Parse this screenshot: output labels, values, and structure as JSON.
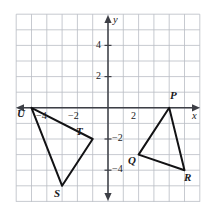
{
  "figure": {
    "colors": {
      "grid": "#b9bcc4",
      "axis": "#3d3f46",
      "shape_stroke": "#121214",
      "text": "#19191c",
      "background": "#ffffff"
    }
  },
  "grid": {
    "x_min": -6,
    "x_max": 6,
    "y_min": -6,
    "y_max": 6,
    "step": 1,
    "show": true
  },
  "axes": {
    "x_label": "x",
    "y_label": "y",
    "x_ticks": [
      {
        "value": -4,
        "label": "−4"
      },
      {
        "value": -2,
        "label": "−2"
      },
      {
        "value": 2,
        "label": "2"
      }
    ],
    "y_ticks": [
      {
        "value": 4,
        "label": "4"
      },
      {
        "value": 2,
        "label": "2"
      },
      {
        "value": -2,
        "label": "−2"
      },
      {
        "value": -4,
        "label": "−4"
      }
    ],
    "arrows": [
      "left",
      "right",
      "up",
      "down"
    ]
  },
  "shapes": [
    {
      "name": "triangle-pqr",
      "label": "PQR",
      "vertices": [
        {
          "label": "P",
          "x": 4,
          "y": 0
        },
        {
          "label": "Q",
          "x": 2,
          "y": -3
        },
        {
          "label": "R",
          "x": 5,
          "y": -4
        }
      ]
    },
    {
      "name": "triangle-stu",
      "label": "STU",
      "vertices": [
        {
          "label": "U",
          "x": -5,
          "y": 0
        },
        {
          "label": "T",
          "x": -1,
          "y": -2
        },
        {
          "label": "S",
          "x": -3,
          "y": -5
        }
      ]
    }
  ],
  "vertex_labels": [
    {
      "text": "P",
      "left": 170,
      "top": 92
    },
    {
      "text": "Q",
      "left": 129,
      "top": 155
    },
    {
      "text": "R",
      "left": 184,
      "top": 172
    },
    {
      "text": "U",
      "left": 17,
      "top": 109
    },
    {
      "text": "T",
      "left": 74,
      "top": 128
    },
    {
      "text": "S",
      "left": 54,
      "top": 189
    }
  ],
  "tick_label_positions": [
    {
      "text": "−4",
      "left": 36,
      "top": 111
    },
    {
      "text": "−2",
      "left": 68,
      "top": 111
    },
    {
      "text": "2",
      "left": 131,
      "top": 111
    },
    {
      "text": "4",
      "left": 96,
      "top": 40
    },
    {
      "text": "2",
      "left": 96,
      "top": 71
    },
    {
      "text": "−2",
      "left": 92,
      "top": 133
    },
    {
      "text": "−4",
      "left": 92,
      "top": 164
    }
  ],
  "axis_label_positions": [
    {
      "text": "y",
      "left": 113,
      "top": 15
    },
    {
      "text": "x",
      "left": 193,
      "top": 111
    }
  ]
}
